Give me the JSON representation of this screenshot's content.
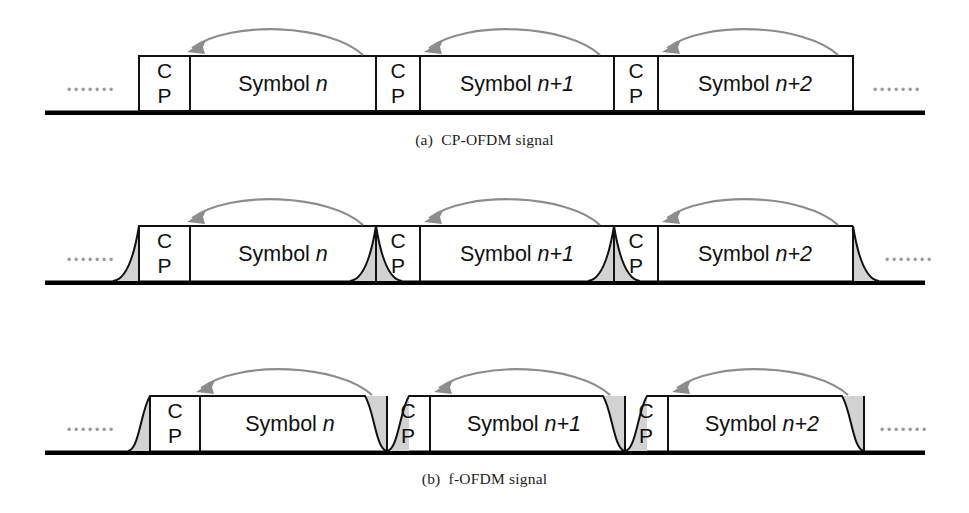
{
  "figure": {
    "colors": {
      "line": "#111111",
      "baseline": "#000000",
      "arrow": "#8c8c8c",
      "tail_fill": "#d2d2d2",
      "ellipsis": "#9a9a9a",
      "caption": "#1d1d1d",
      "background": "#ffffff"
    },
    "ellipsis_glyph": "•••••••",
    "panels": [
      {
        "id": "a",
        "caption": "(a)  CP-OFDM signal",
        "waveform": "rectangular",
        "ellipsis_left": "•••••••",
        "ellipsis_right": "•••••••",
        "blocks": [
          {
            "kind": "cp",
            "label_lines": [
              "C",
              "P"
            ]
          },
          {
            "kind": "symbol",
            "label": "Symbol ",
            "index": "n"
          },
          {
            "kind": "cp",
            "label_lines": [
              "C",
              "P"
            ]
          },
          {
            "kind": "symbol",
            "label": "Symbol ",
            "index": "n+1"
          },
          {
            "kind": "cp",
            "label_lines": [
              "C",
              "P"
            ]
          },
          {
            "kind": "symbol",
            "label": "Symbol ",
            "index": "n+2"
          }
        ],
        "arrows": 3
      },
      {
        "id": "b",
        "caption": "(b)  f-OFDM signal",
        "waveform": "exponential-tail",
        "ellipsis_left": "•••••••",
        "ellipsis_right": "•••••••",
        "blocks": [
          {
            "kind": "cp",
            "label_lines": [
              "C",
              "P"
            ]
          },
          {
            "kind": "symbol",
            "label": "Symbol ",
            "index": "n"
          },
          {
            "kind": "cp",
            "label_lines": [
              "C",
              "P"
            ]
          },
          {
            "kind": "symbol",
            "label": "Symbol ",
            "index": "n+1"
          },
          {
            "kind": "cp",
            "label_lines": [
              "C",
              "P"
            ]
          },
          {
            "kind": "symbol",
            "label": "Symbol ",
            "index": "n+2"
          }
        ],
        "arrows": 3
      },
      {
        "id": "c",
        "caption": "(c)  W-OFDM signal",
        "waveform": "raised-cosine-rolloff",
        "ellipsis_left": "•••••••",
        "ellipsis_right": "•••••••",
        "blocks": [
          {
            "kind": "cp",
            "label_lines": [
              "C",
              "P"
            ]
          },
          {
            "kind": "symbol",
            "label": "Symbol ",
            "index": "n"
          },
          {
            "kind": "cp",
            "label_lines": [
              "C",
              "P"
            ]
          },
          {
            "kind": "symbol",
            "label": "Symbol ",
            "index": "n+1"
          },
          {
            "kind": "cp",
            "label_lines": [
              "C",
              "P"
            ]
          },
          {
            "kind": "symbol",
            "label": "Symbol ",
            "index": "n+2"
          }
        ],
        "arrows": 3
      }
    ],
    "labels": {
      "cp_c": "C",
      "cp_p": "P",
      "symbol_word": "Symbol ",
      "idx_n": "n",
      "idx_n1": "n+1",
      "idx_n2": "n+2"
    }
  }
}
